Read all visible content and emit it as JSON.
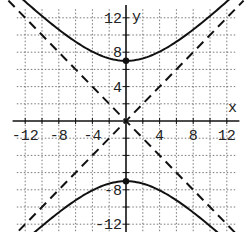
{
  "chart_data": {
    "type": "line",
    "title": "",
    "xlabel": "x",
    "ylabel": "y",
    "xlim": [
      -12,
      12
    ],
    "ylim": [
      -12,
      12
    ],
    "grid": true,
    "grid_style": "dotted",
    "x_ticks": [
      -12,
      -8,
      -4,
      4,
      8,
      12
    ],
    "y_ticks": [
      12,
      4,
      -8,
      -12
    ],
    "x_tick_labels": [
      "-12",
      "-8",
      "-4",
      "4",
      "8",
      "12"
    ],
    "y_tick_labels": [
      "12",
      "8",
      "4",
      "-8",
      "-12"
    ],
    "series": [
      {
        "name": "hyperbola upper branch",
        "equation": "y^2/49 - x^2/49 = 1",
        "style": "solid",
        "x": [
          -11,
          -9,
          -7,
          -5,
          -3,
          -1,
          0,
          1,
          3,
          5,
          7,
          9,
          11
        ],
        "values": [
          13.04,
          11.4,
          9.9,
          8.6,
          7.62,
          7.07,
          7,
          7.07,
          7.62,
          8.6,
          9.9,
          11.4,
          13.04
        ]
      },
      {
        "name": "hyperbola lower branch",
        "style": "solid",
        "x": [
          -11,
          -9,
          -7,
          -5,
          -3,
          -1,
          0,
          1,
          3,
          5,
          7,
          9,
          11
        ],
        "values": [
          -13.04,
          -11.4,
          -9.9,
          -8.6,
          -7.62,
          -7.07,
          -7,
          -7.07,
          -7.62,
          -8.6,
          -9.9,
          -11.4,
          -13.04
        ]
      },
      {
        "name": "asymptote y = x",
        "style": "dashed",
        "x": [
          -12,
          12
        ],
        "values": [
          -12,
          12
        ]
      },
      {
        "name": "asymptote y = -x",
        "style": "dashed",
        "x": [
          -12,
          12
        ],
        "values": [
          12,
          -12
        ]
      }
    ],
    "points": [
      {
        "label": "vertex",
        "x": 0,
        "y": 7
      },
      {
        "label": "vertex",
        "x": 0,
        "y": -7
      }
    ]
  },
  "axes": {
    "x_label": "x",
    "y_label": "y"
  }
}
